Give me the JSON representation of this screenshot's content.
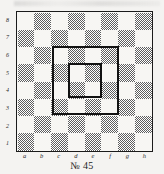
{
  "caption": "№ 45",
  "board": {
    "files": [
      "a",
      "b",
      "c",
      "d",
      "e",
      "f",
      "g",
      "h"
    ],
    "ranks": [
      "8",
      "7",
      "6",
      "5",
      "4",
      "3",
      "2",
      "1"
    ],
    "light_color": "#f7f6f3",
    "dark_color": "#5e5e5e",
    "border_color": "#1b1b1b",
    "size": 8,
    "a8_is_light": true
  },
  "highlights": [
    {
      "name": "outer-square",
      "from": "c3",
      "to": "f6",
      "color": "#111111",
      "width": 2
    },
    {
      "name": "inner-square",
      "from": "d4",
      "to": "e5",
      "color": "#111111",
      "width": 2
    }
  ],
  "chart_data": {
    "type": "heatmap",
    "title": "№ 45",
    "xlabel": "",
    "ylabel": "",
    "categories": [
      "a",
      "b",
      "c",
      "d",
      "e",
      "f",
      "g",
      "h"
    ],
    "rows": [
      "8",
      "7",
      "6",
      "5",
      "4",
      "3",
      "2",
      "1"
    ],
    "values": [
      [
        0,
        1,
        0,
        1,
        0,
        1,
        0,
        1
      ],
      [
        1,
        0,
        1,
        0,
        1,
        0,
        1,
        0
      ],
      [
        0,
        1,
        0,
        1,
        0,
        1,
        0,
        1
      ],
      [
        1,
        0,
        1,
        0,
        1,
        0,
        1,
        0
      ],
      [
        0,
        1,
        0,
        1,
        0,
        1,
        0,
        1
      ],
      [
        1,
        0,
        1,
        0,
        1,
        0,
        1,
        0
      ],
      [
        0,
        1,
        0,
        1,
        0,
        1,
        0,
        1
      ],
      [
        1,
        0,
        1,
        0,
        1,
        0,
        1,
        0
      ]
    ],
    "legend": [
      "light square = 0",
      "dark square = 1"
    ],
    "annotations": [
      {
        "label": "outer square outline",
        "region": "c3-f6"
      },
      {
        "label": "inner square outline",
        "region": "d4-e5"
      }
    ]
  }
}
